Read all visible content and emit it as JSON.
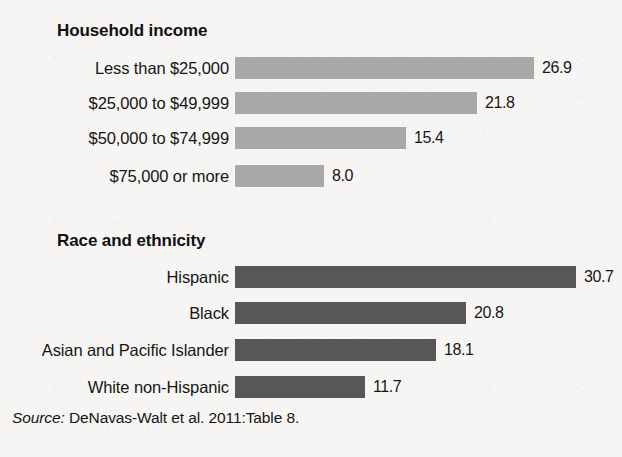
{
  "chart_data": {
    "type": "bar",
    "title": "",
    "orientation": "horizontal",
    "xlabel": "",
    "ylabel": "",
    "value_axis_max": 34.8,
    "grid": false,
    "legend": false,
    "groups": [
      {
        "heading": "Household income",
        "bar_color": "#a9a9a9",
        "categories": [
          "Less than $25,000",
          "$25,000 to $49,999",
          "$50,000 to $74,999",
          "$75,000 or more"
        ],
        "values": [
          26.9,
          21.8,
          15.4,
          8.0
        ],
        "value_labels": [
          "26.9",
          "21.8",
          "15.4",
          "8.0"
        ]
      },
      {
        "heading": "Race and ethnicity",
        "bar_color": "#575757",
        "categories": [
          "Hispanic",
          "Black",
          "Asian and Pacific Islander",
          "White non-Hispanic"
        ],
        "values": [
          30.7,
          20.8,
          18.1,
          11.7
        ],
        "value_labels": [
          "30.7",
          "20.8",
          "18.1",
          "11.7"
        ]
      }
    ],
    "source_prefix": "Source:",
    "source_text": "DeNavas-Walt et al. 2011:Table 8."
  },
  "groups": {
    "income": {
      "heading": "Household income",
      "rows": [
        {
          "label": "Less than $25,000",
          "value_label": "26.9"
        },
        {
          "label": "$25,000 to $49,999",
          "value_label": "21.8"
        },
        {
          "label": "$50,000 to $74,999",
          "value_label": "15.4"
        },
        {
          "label": "$75,000 or more",
          "value_label": "8.0"
        }
      ]
    },
    "race": {
      "heading": "Race and ethnicity",
      "rows": [
        {
          "label": "Hispanic",
          "value_label": "30.7"
        },
        {
          "label": "Black",
          "value_label": "20.8"
        },
        {
          "label": "Asian and Pacific Islander",
          "value_label": "18.1"
        },
        {
          "label": "White non-Hispanic",
          "value_label": "11.7"
        }
      ]
    }
  },
  "source": {
    "prefix": "Source:",
    "text": "DeNavas-Walt et al. 2011:Table 8."
  },
  "colors": {
    "background": "#f6f5f3",
    "light_bar": "#a9a9a9",
    "dark_bar": "#575757",
    "text": "#151515"
  }
}
